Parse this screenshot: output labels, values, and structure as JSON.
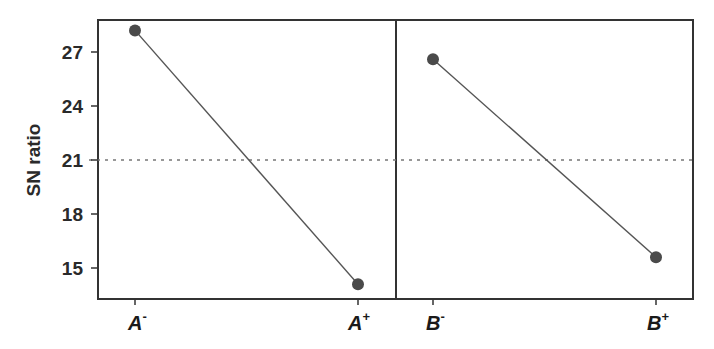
{
  "chart_data": {
    "type": "line",
    "title": "",
    "xlabel": "",
    "ylabel": "SN ratio",
    "ylim": [
      13.3,
      28.9
    ],
    "yticks": [
      15,
      18,
      21,
      24,
      27
    ],
    "grid": false,
    "legend": null,
    "reference_line": {
      "y": 21,
      "style": "dotted",
      "label": "mean SN ratio"
    },
    "panels": [
      {
        "factor": "A",
        "categories": [
          "A-",
          "A+"
        ],
        "category_labels": [
          {
            "base": "A",
            "sup": "-"
          },
          {
            "base": "A",
            "sup": "+"
          }
        ],
        "values": [
          28.2,
          14.1
        ]
      },
      {
        "factor": "B",
        "categories": [
          "B-",
          "B+"
        ],
        "category_labels": [
          {
            "base": "B",
            "sup": "-"
          },
          {
            "base": "B",
            "sup": "+"
          }
        ],
        "values": [
          26.6,
          15.6
        ]
      }
    ],
    "colors": {
      "line": "#555555",
      "marker": "#4a4a4a",
      "frame": "#333333",
      "reference": "#777777"
    }
  },
  "labels": {
    "ylabel": "SN ratio",
    "yticks": [
      "15",
      "18",
      "21",
      "24",
      "27"
    ],
    "x": {
      "a_minus_base": "A",
      "a_minus_sup": "-",
      "a_plus_base": "A",
      "a_plus_sup": "+",
      "b_minus_base": "B",
      "b_minus_sup": "-",
      "b_plus_base": "B",
      "b_plus_sup": "+"
    }
  }
}
